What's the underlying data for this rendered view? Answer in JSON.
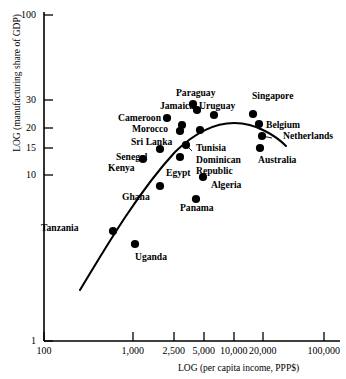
{
  "chart_data": {
    "type": "scatter",
    "title": "",
    "xlabel": "LOG (per capita income, PPP$)",
    "ylabel": "LOG (manufacturing share of GDP)",
    "xscale": "log",
    "yscale": "log",
    "xlim": [
      100,
      150000
    ],
    "ylim": [
      1,
      100
    ],
    "grid": false,
    "legend": false,
    "xticks": [
      {
        "value": 100,
        "label": "100"
      },
      {
        "value": 1000,
        "label": "1,000"
      },
      {
        "value": 2500,
        "label": "2,500"
      },
      {
        "value": 5000,
        "label": "5,000"
      },
      {
        "value": 10000,
        "label": "10,000"
      },
      {
        "value": 20000,
        "label": "20,000"
      },
      {
        "value": 100000,
        "label": "100,000"
      }
    ],
    "yticks": [
      {
        "value": 1,
        "label": "1"
      },
      {
        "value": 10,
        "label": "10"
      },
      {
        "value": 15,
        "label": "15"
      },
      {
        "value": 20,
        "label": "20"
      },
      {
        "value": 30,
        "label": "30"
      },
      {
        "value": 100,
        "label": "100"
      }
    ],
    "points": [
      {
        "name": "Cameroon",
        "x": 2050,
        "y": 21.0,
        "px": 167,
        "py": 118,
        "label_px": 118,
        "label_py": 113,
        "leader": false
      },
      {
        "name": "Jamaica",
        "x": 5400,
        "y": 24.0,
        "px": 197,
        "py": 110,
        "label_px": 160,
        "label_py": 101,
        "leader": true,
        "leader_x2": 192,
        "leader_y2": 107
      },
      {
        "name": "Paraguay",
        "x": 4700,
        "y": 27.0,
        "px": 193,
        "py": 104,
        "label_px": 176,
        "label_py": 88,
        "leader": true,
        "leader_x2": 190,
        "leader_y2": 101
      },
      {
        "name": "Uruguay",
        "x": 8500,
        "y": 22.0,
        "px": 214,
        "py": 115,
        "label_px": 199,
        "label_py": 101,
        "leader": false
      },
      {
        "name": "Singapore",
        "x": 20000,
        "y": 22.5,
        "px": 253,
        "py": 114,
        "label_px": 252,
        "label_py": 91,
        "leader": false
      },
      {
        "name": "Morocco",
        "x": 3400,
        "y": 18.5,
        "px": 182,
        "py": 125,
        "label_px": 132,
        "label_py": 124,
        "leader": false
      },
      {
        "name": "Sri Lanka",
        "x": 3300,
        "y": 17.0,
        "px": 180,
        "py": 131,
        "label_px": 131,
        "label_py": 137,
        "leader": false
      },
      {
        "name": "Belgium",
        "x": 24000,
        "y": 19.0,
        "px": 259,
        "py": 124,
        "label_px": 266,
        "label_py": 120,
        "leader": false
      },
      {
        "name": "Netherlands",
        "x": 26000,
        "y": 16.5,
        "px": 262,
        "py": 136,
        "label_px": 283,
        "label_py": 131,
        "leader": true,
        "leader_x2": 272,
        "leader_y2": 138
      },
      {
        "name": "Senegal",
        "x": 1700,
        "y": 14.0,
        "px": 160,
        "py": 149,
        "label_px": 116,
        "label_py": 152,
        "leader": false
      },
      {
        "name": "Tunisia",
        "x": 6000,
        "y": 17.5,
        "px": 200,
        "py": 130,
        "label_px": 196,
        "label_py": 143,
        "leader": false
      },
      {
        "name": "Dominican Republic",
        "x": 5200,
        "y": 15.0,
        "px": 186,
        "py": 145,
        "label_px": 196,
        "label_py": 155,
        "leader": true,
        "leader_x2": 192,
        "leader_y2": 151
      },
      {
        "name": "Australia",
        "x": 25000,
        "y": 14.0,
        "px": 260,
        "py": 148,
        "label_px": 258,
        "label_py": 155,
        "leader": false
      },
      {
        "name": "Kenya",
        "x": 1250,
        "y": 12.0,
        "px": 143,
        "py": 159,
        "label_px": 108,
        "label_py": 163,
        "leader": false
      },
      {
        "name": "Egypt",
        "x": 3500,
        "y": 12.5,
        "px": 180,
        "py": 157,
        "label_px": 166,
        "label_py": 168,
        "leader": false
      },
      {
        "name": "Algeria",
        "x": 6000,
        "y": 11.0,
        "px": 203,
        "py": 177,
        "label_px": 211,
        "label_py": 180,
        "leader": false
      },
      {
        "name": "Ghana",
        "x": 1900,
        "y": 9.0,
        "px": 160,
        "py": 186,
        "label_px": 122,
        "label_py": 192,
        "leader": false
      },
      {
        "name": "Panama",
        "x": 5300,
        "y": 8.6,
        "px": 196,
        "py": 199,
        "label_px": 180,
        "label_py": 203,
        "leader": false
      },
      {
        "name": "Tanzania",
        "x": 700,
        "y": 6.2,
        "px": 113,
        "py": 231,
        "label_px": 41,
        "label_py": 223,
        "leader": false
      },
      {
        "name": "Uganda",
        "x": 1150,
        "y": 5.2,
        "px": 135,
        "py": 244,
        "label_px": 135,
        "label_py": 252,
        "leader": false
      }
    ],
    "fitted_curve": {
      "description": "inverted-U log-quadratic fit of manufacturing share on per capita income",
      "path": "M 80,290 C 110,240 140,190 175,152 C 210,118 240,118 265,131 C 275,136 281,141 286,146"
    }
  }
}
